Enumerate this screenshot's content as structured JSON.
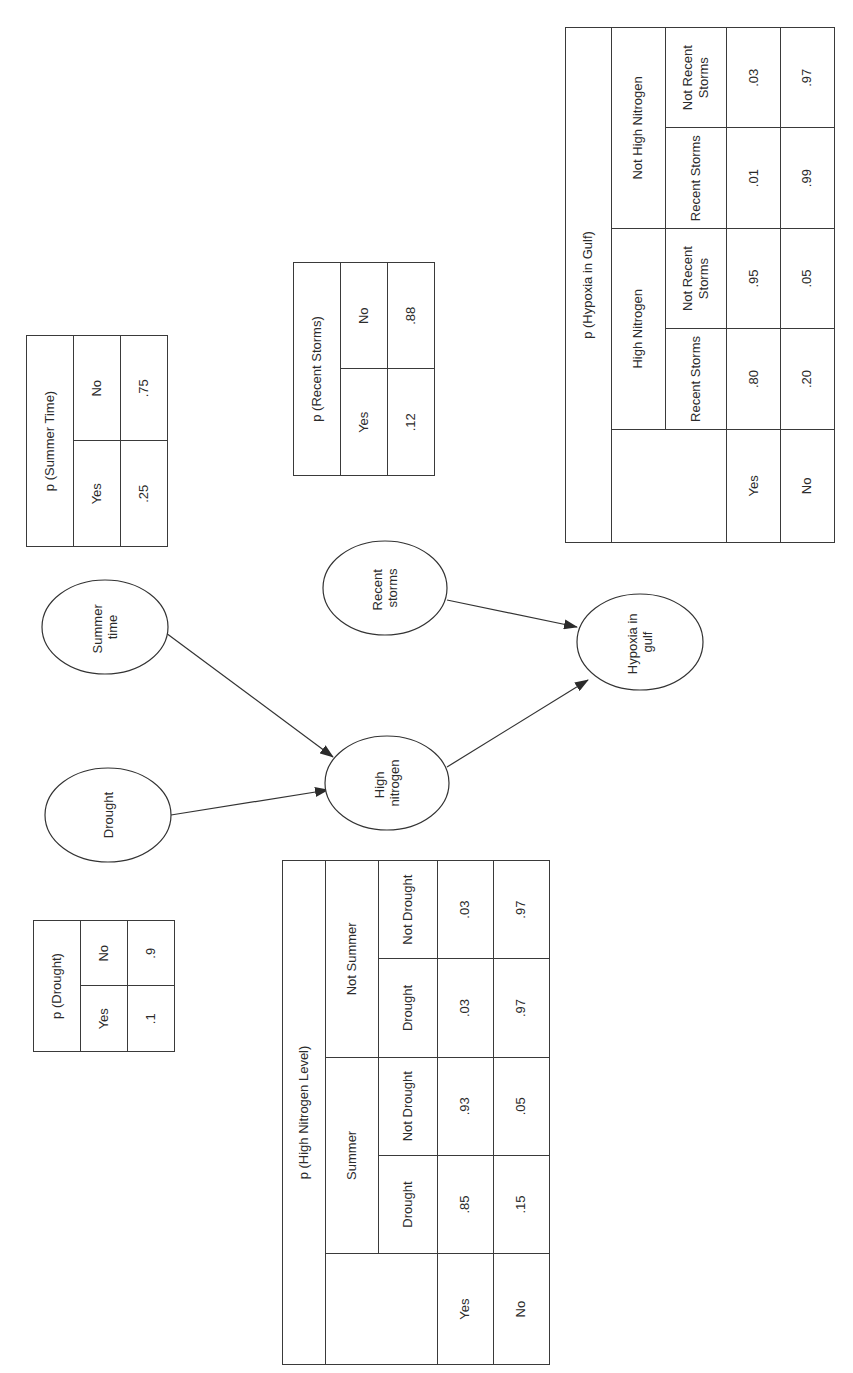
{
  "diagram": {
    "nodes": [
      {
        "id": "summer",
        "lines": [
          "Summer",
          "time"
        ]
      },
      {
        "id": "drought",
        "lines": [
          "Drought"
        ]
      },
      {
        "id": "nitrogen",
        "lines": [
          "High",
          "nitrogen"
        ]
      },
      {
        "id": "storms",
        "lines": [
          "Recent",
          "storms"
        ]
      },
      {
        "id": "hypoxia",
        "lines": [
          "Hypoxia in",
          "gulf"
        ]
      }
    ],
    "edges": [
      {
        "from": "summer",
        "to": "nitrogen"
      },
      {
        "from": "drought",
        "to": "nitrogen"
      },
      {
        "from": "nitrogen",
        "to": "hypoxia"
      },
      {
        "from": "storms",
        "to": "hypoxia"
      }
    ]
  },
  "tables": {
    "summer": {
      "title": "p (Summer Time)",
      "headers": [
        "Yes",
        "No"
      ],
      "values": [
        ".25",
        ".75"
      ]
    },
    "drought": {
      "title": "p (Drought)",
      "headers": [
        "Yes",
        "No"
      ],
      "values": [
        ".1",
        ".9"
      ]
    },
    "storms": {
      "title": "p (Recent Storms)",
      "headers": [
        "Yes",
        "No"
      ],
      "values": [
        ".12",
        ".88"
      ]
    },
    "nitrogen": {
      "title": "p (High Nitrogen Level)",
      "groups": [
        "Summer",
        "Not Summer"
      ],
      "subheaders": [
        "Drought",
        "Not Drought",
        "Drought",
        "Not Drought"
      ],
      "rows": [
        {
          "label": "Yes",
          "values": [
            ".85",
            ".93",
            ".03",
            ".03"
          ]
        },
        {
          "label": "No",
          "values": [
            ".15",
            ".05",
            ".97",
            ".97"
          ]
        }
      ]
    },
    "hypoxia": {
      "title": "p (Hypoxia in Gulf)",
      "groups": [
        "High Nitrogen",
        "Not High Nitrogen"
      ],
      "subheaders": [
        "Recent Storms",
        "Not Recent Storms",
        "Recent Storms",
        "Not Recent Storms"
      ],
      "rows": [
        {
          "label": "Yes",
          "values": [
            ".80",
            ".95",
            ".01",
            ".03"
          ]
        },
        {
          "label": "No",
          "values": [
            ".20",
            ".05",
            ".99",
            ".97"
          ]
        }
      ]
    }
  }
}
